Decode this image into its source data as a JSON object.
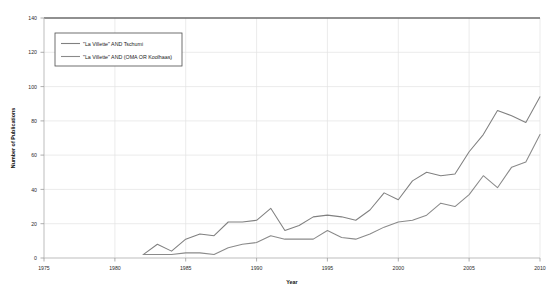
{
  "chart_data": {
    "type": "line",
    "title": "",
    "xlabel": "Year",
    "ylabel": "Number of Publications",
    "xlim": [
      1975,
      2010
    ],
    "ylim": [
      0,
      140
    ],
    "xticks": [
      "1975",
      "1980",
      "1985",
      "1990",
      "1995",
      "2000",
      "2005",
      "2010"
    ],
    "yticks": [
      "0",
      "20",
      "40",
      "60",
      "80",
      "100",
      "120",
      "140"
    ],
    "grid": true,
    "legend_position": "top-left",
    "x": [
      1982,
      1983,
      1984,
      1985,
      1986,
      1987,
      1988,
      1989,
      1990,
      1991,
      1992,
      1993,
      1994,
      1995,
      1996,
      1997,
      1998,
      1999,
      2000,
      2001,
      2002,
      2003,
      2004,
      2005,
      2006,
      2007,
      2008,
      2009,
      2010
    ],
    "series": [
      {
        "name": "\"La Villette\" AND Tschumi",
        "color": "#808080",
        "values": [
          2,
          8,
          4,
          11,
          14,
          13,
          21,
          21,
          22,
          29,
          16,
          19,
          24,
          25,
          24,
          22,
          28,
          38,
          34,
          45,
          50,
          48,
          49,
          62,
          72,
          86,
          83,
          79,
          94
        ]
      },
      {
        "name": "\"La Villette\" AND (OMA OR Koolhaas)",
        "color": "#8a8a8a",
        "values": [
          2,
          2,
          2,
          3,
          3,
          2,
          6,
          8,
          9,
          13,
          11,
          11,
          11,
          16,
          12,
          11,
          14,
          18,
          21,
          22,
          25,
          32,
          30,
          37,
          48,
          41,
          53,
          56,
          72
        ]
      }
    ]
  },
  "legend": {
    "entries": [
      {
        "label": "\"La Villette\" AND Tschumi"
      },
      {
        "label": "\"La Villette\" AND (OMA OR Koolhaas)"
      }
    ]
  },
  "axes": {
    "y_title": "Number of Publications",
    "x_title": "Year"
  }
}
